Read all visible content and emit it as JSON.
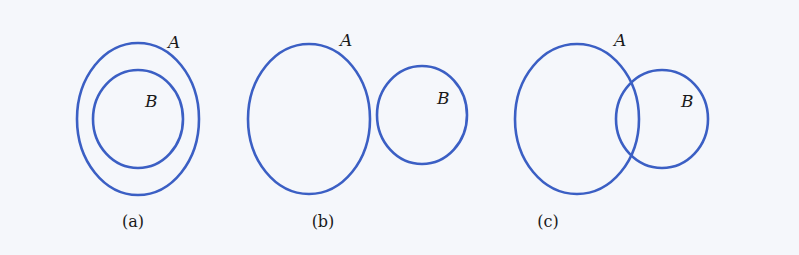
{
  "figure": {
    "panels": [
      {
        "caption": "(a)",
        "relation": "B subset of A",
        "sets": [
          {
            "name": "A",
            "cx": 138,
            "cy": 119,
            "rx": 61,
            "ry": 76,
            "label_x": 168,
            "label_y": 48
          },
          {
            "name": "B",
            "cx": 138,
            "cy": 119,
            "rx": 45,
            "ry": 49,
            "label_x": 145,
            "label_y": 107
          }
        ],
        "caption_x": 133
      },
      {
        "caption": "(b)",
        "relation": "A and B disjoint",
        "sets": [
          {
            "name": "A",
            "cx": 309,
            "cy": 119,
            "rx": 61,
            "ry": 75,
            "label_x": 340,
            "label_y": 46
          },
          {
            "name": "B",
            "cx": 422,
            "cy": 115,
            "rx": 45,
            "ry": 49,
            "label_x": 437,
            "label_y": 104
          }
        ],
        "caption_x": 323
      },
      {
        "caption": "(c)",
        "relation": "A and B overlap",
        "sets": [
          {
            "name": "A",
            "cx": 577,
            "cy": 119,
            "rx": 62,
            "ry": 75,
            "label_x": 614,
            "label_y": 46
          },
          {
            "name": "B",
            "cx": 662,
            "cy": 119,
            "rx": 46,
            "ry": 49,
            "label_x": 681,
            "label_y": 107
          }
        ],
        "caption_x": 548
      }
    ],
    "caption_y": 227,
    "stroke_color": "#3b5fc4",
    "background": "#f5f7fb"
  }
}
